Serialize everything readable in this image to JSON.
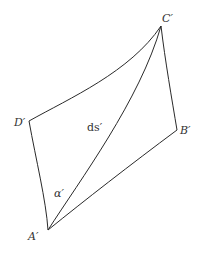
{
  "diagram": {
    "type": "deformed-element",
    "stroke_color": "#2a2a2a",
    "label_color": "#333333",
    "vertices": {
      "A": {
        "label": "A′",
        "x": 48,
        "y": 230
      },
      "B": {
        "label": "B′",
        "x": 177,
        "y": 130
      },
      "C": {
        "label": "C′",
        "x": 161,
        "y": 26
      },
      "D": {
        "label": "D′",
        "x": 29,
        "y": 121
      }
    },
    "labels": {
      "A": "A′",
      "B": "B′",
      "C": "C′",
      "D": "D′",
      "diagonal": "ds′",
      "angle": "α′"
    },
    "edges": [
      {
        "from": "D′",
        "to": "C′",
        "shape": "curve"
      },
      {
        "from": "C′",
        "to": "B′",
        "shape": "near-straight"
      },
      {
        "from": "B′",
        "to": "A′",
        "shape": "curve"
      },
      {
        "from": "A′",
        "to": "D′",
        "shape": "near-straight"
      },
      {
        "from": "A′",
        "to": "C′",
        "shape": "curve",
        "label": "ds′"
      }
    ]
  }
}
